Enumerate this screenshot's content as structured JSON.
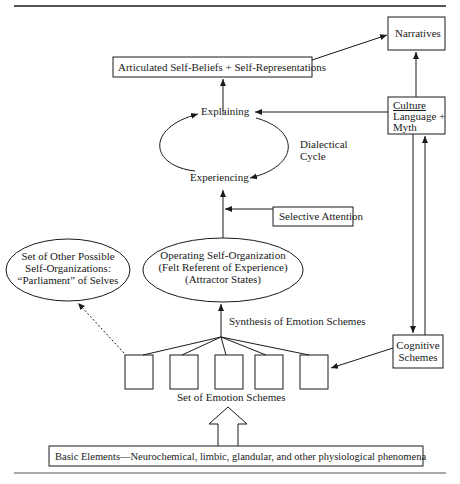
{
  "diagram": {
    "nodes": {
      "narratives": "Narratives",
      "articulated": "Articulated Self-Beliefs + Self-Representations",
      "explaining": "Explaining",
      "experiencing": "Experiencing",
      "dialectical_line1": "Dialectical",
      "dialectical_line2": "Cycle",
      "culture_title": "Culture",
      "culture_line2": "Language +",
      "culture_line3": "Myth",
      "selective_attention": "Selective Attention",
      "other_selves_line1": "Set of Other Possible",
      "other_selves_line2": "Self-Organizations:",
      "other_selves_line3": "“Parliament” of Selves",
      "operating_line1": "Operating Self-Organization",
      "operating_line2": "(Felt Referent of Experience)",
      "operating_line3": "(Attractor States)",
      "synthesis": "Synthesis of Emotion Schemes",
      "cognitive_line1": "Cognitive",
      "cognitive_line2": "Schemes",
      "emotion_schemes_label": "Set of Emotion Schemes",
      "basic_elements": "Basic Elements—Neurochemical, limbic, glandular, and other physiological phenomena"
    },
    "emotion_scheme_boxes": 5
  }
}
